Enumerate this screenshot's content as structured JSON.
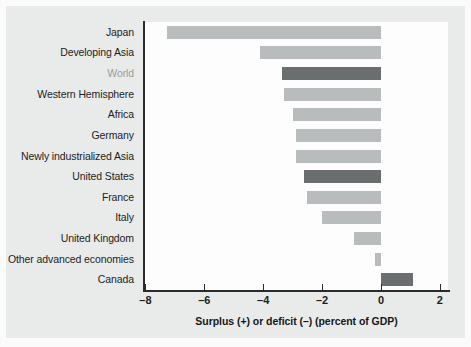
{
  "chart_data": {
    "type": "bar",
    "orientation": "horizontal",
    "title": "",
    "xlabel": "Surplus (+) or deficit (–) (percent of GDP)",
    "ylabel": "",
    "xlim": [
      -8,
      2.6
    ],
    "xticks": [
      -8,
      -6,
      -4,
      -2,
      0,
      2
    ],
    "xtick_labels": [
      "–8",
      "–6",
      "–4",
      "–2",
      "0",
      "2"
    ],
    "grid": false,
    "legend": null,
    "categories": [
      "Japan",
      "Developing Asia",
      "World",
      "Western Hemisphere",
      "Africa",
      "Germany",
      "Newly industrialized Asia",
      "United States",
      "France",
      "Italy",
      "United Kingdom",
      "Other advanced economies",
      "Canada"
    ],
    "values": [
      -7.25,
      -4.1,
      -3.35,
      -3.3,
      -3.0,
      -2.9,
      -2.9,
      -2.6,
      -2.5,
      -2.0,
      -0.9,
      -0.2,
      1.1
    ],
    "bar_styles": [
      "light",
      "light",
      "dark",
      "light",
      "light",
      "light",
      "light",
      "dark",
      "light",
      "light",
      "light",
      "light",
      "dark"
    ],
    "label_styles": [
      "normal",
      "normal",
      "muted",
      "normal",
      "normal",
      "normal",
      "normal",
      "normal",
      "normal",
      "normal",
      "normal",
      "normal",
      "normal"
    ],
    "colors": {
      "bar_light": "#b9bcbc",
      "bar_dark": "#6a6e6e",
      "axis": "#2b2b2b",
      "plot_background": "#fdfdfd",
      "panel_background": "#e9eaea",
      "page_background": "#fbfbfb",
      "label_text": "#1d1d1d",
      "label_muted": "#9a9c9c"
    }
  }
}
